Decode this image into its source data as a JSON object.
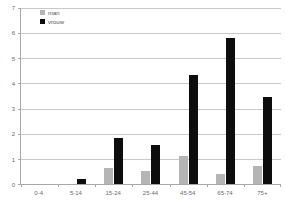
{
  "chart_data": {
    "type": "bar",
    "title": "",
    "subtitle": "",
    "xlabel": "",
    "ylabel": "",
    "categories": [
      "0-4",
      "5-14",
      "15-24",
      "25-44",
      "45-54",
      "65-74",
      "75+"
    ],
    "series": [
      {
        "name": "man",
        "color": "#b5b5b5",
        "values": [
          0,
          0,
          0.65,
          0.5,
          1.1,
          0.4,
          0.72
        ]
      },
      {
        "name": "vrouw",
        "color": "#0d0d0d",
        "values": [
          0,
          0.2,
          1.85,
          1.55,
          4.35,
          5.8,
          3.45
        ]
      }
    ],
    "ylim": [
      0,
      7
    ],
    "yticks": [
      0,
      1,
      2,
      3,
      4,
      5,
      6,
      7
    ],
    "ytick_labels": [
      "0",
      "1",
      "2",
      "3",
      "4",
      "5",
      "6",
      "7"
    ],
    "grid": true,
    "legend_position": "top-left",
    "axis_color": "#a8a8a8",
    "grid_color": "#c9c9c9",
    "tick_label_color": "#6b6b6b"
  }
}
